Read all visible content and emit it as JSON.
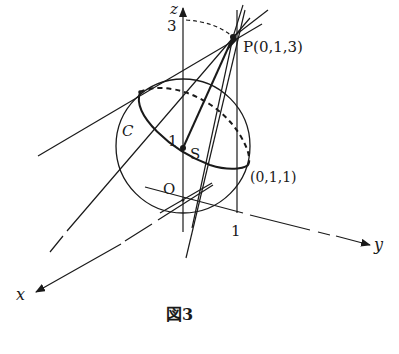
{
  "figure": {
    "caption": "図3",
    "labels": {
      "z_axis": "z",
      "x_axis": "x",
      "y_axis": "y",
      "z_tick": "3",
      "y_tick": "1",
      "origin": "O",
      "point_p": "P(0,1,3)",
      "point_s": "S",
      "radius_label": "1",
      "circle_c": "C",
      "point_011": "(0,1,1)"
    }
  },
  "colors": {
    "ink": "#1a1a1a",
    "background": "#ffffff"
  }
}
